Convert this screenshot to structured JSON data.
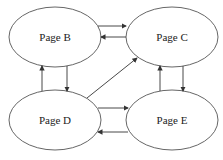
{
  "diagram": {
    "type": "directed-graph",
    "nodes": [
      {
        "id": "B",
        "label": "Page B"
      },
      {
        "id": "C",
        "label": "Page C"
      },
      {
        "id": "D",
        "label": "Page D"
      },
      {
        "id": "E",
        "label": "Page E"
      }
    ],
    "edges": [
      {
        "from": "B",
        "to": "C"
      },
      {
        "from": "C",
        "to": "B"
      },
      {
        "from": "B",
        "to": "D"
      },
      {
        "from": "D",
        "to": "B"
      },
      {
        "from": "D",
        "to": "C"
      },
      {
        "from": "C",
        "to": "E"
      },
      {
        "from": "E",
        "to": "C"
      },
      {
        "from": "D",
        "to": "E"
      },
      {
        "from": "E",
        "to": "D"
      }
    ],
    "caption": ""
  },
  "colors": {
    "stroke": "#333333",
    "background": "#ffffff"
  }
}
